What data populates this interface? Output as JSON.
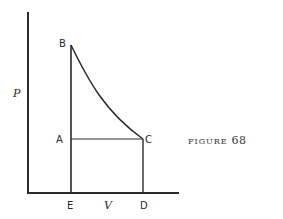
{
  "diagram": {
    "type": "pressure-volume diagram",
    "axes": {
      "y_label": "P",
      "x_label": "V"
    },
    "points": {
      "B": {
        "label": "B"
      },
      "A": {
        "label": "A"
      },
      "C": {
        "label": "C"
      },
      "D": {
        "label": "D"
      },
      "E": {
        "label": "E"
      }
    },
    "edges": [
      "E-B (vertical)",
      "B-C (curve)",
      "A-C (horizontal)",
      "C-D (vertical)",
      "E-D (on V axis)"
    ],
    "colors": {
      "ink": "#2a2a2a",
      "background": "#ffffff"
    }
  },
  "caption": {
    "word": "FIGURE",
    "number": "68"
  }
}
